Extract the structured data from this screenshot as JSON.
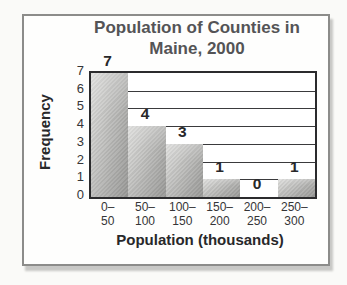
{
  "chart_data": {
    "type": "bar",
    "title": "Population of Counties in Maine, 2000",
    "title_lines": [
      "Population of Counties in",
      "Maine, 2000"
    ],
    "xlabel": "Population (thousands)",
    "ylabel": "Frequency",
    "categories": [
      "0–50",
      "50–100",
      "100–150",
      "150–200",
      "200–250",
      "250–300"
    ],
    "bin_labels": [
      [
        "0–",
        "50"
      ],
      [
        "50–",
        "100"
      ],
      [
        "100–",
        "150"
      ],
      [
        "150–",
        "200"
      ],
      [
        "200–",
        "250"
      ],
      [
        "250–",
        "300"
      ]
    ],
    "values": [
      7,
      4,
      3,
      1,
      0,
      1
    ],
    "ylim": [
      0,
      7
    ],
    "ytick_step": 1,
    "grid": "horizontal",
    "legend": "none",
    "bar_gap": 0
  },
  "colors": {
    "page_bg": "#fafaf8",
    "frame_border": "#8c8c8a",
    "title_text": "#545456",
    "tick_text": "#353537",
    "axis_line": "#2b2b2d",
    "bar_light": "#d7d7d5",
    "bar_dark": "#ababa9"
  }
}
